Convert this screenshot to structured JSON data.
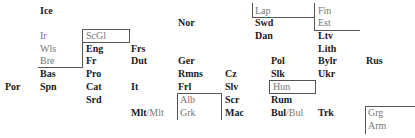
{
  "diagram": {
    "type": "language-map-grid",
    "labels": [
      {
        "id": "ice",
        "text": "Ice",
        "x": 40,
        "y": 5,
        "style": "bold"
      },
      {
        "id": "lap",
        "text": "Lap",
        "x": 255,
        "y": 5,
        "style": "gray"
      },
      {
        "id": "fin",
        "text": "Fin",
        "x": 318,
        "y": 5,
        "style": "gray"
      },
      {
        "id": "nor",
        "text": "Nor",
        "x": 178,
        "y": 17,
        "style": "bold"
      },
      {
        "id": "swd",
        "text": "Swd",
        "x": 255,
        "y": 17,
        "style": "bold"
      },
      {
        "id": "est",
        "text": "Est",
        "x": 318,
        "y": 17,
        "style": "gray"
      },
      {
        "id": "ir",
        "text": "Ir",
        "x": 40,
        "y": 30,
        "style": "gray"
      },
      {
        "id": "scgl",
        "text": "ScGl",
        "x": 86,
        "y": 30,
        "style": "gray"
      },
      {
        "id": "dan",
        "text": "Dan",
        "x": 255,
        "y": 30,
        "style": "bold"
      },
      {
        "id": "ltv",
        "text": "Ltv",
        "x": 318,
        "y": 30,
        "style": "bold"
      },
      {
        "id": "wls",
        "text": "Wls",
        "x": 40,
        "y": 43,
        "style": "gray"
      },
      {
        "id": "eng",
        "text": "Eng",
        "x": 86,
        "y": 43,
        "style": "bold"
      },
      {
        "id": "frs",
        "text": "Frs",
        "x": 131,
        "y": 43,
        "style": "bold"
      },
      {
        "id": "lith",
        "text": "Lith",
        "x": 318,
        "y": 43,
        "style": "bold"
      },
      {
        "id": "bre",
        "text": "Bre",
        "x": 40,
        "y": 55,
        "style": "gray"
      },
      {
        "id": "fr",
        "text": "Fr",
        "x": 86,
        "y": 55,
        "style": "bold"
      },
      {
        "id": "dut",
        "text": "Dut",
        "x": 131,
        "y": 55,
        "style": "bold"
      },
      {
        "id": "ger",
        "text": "Ger",
        "x": 178,
        "y": 55,
        "style": "bold"
      },
      {
        "id": "pol",
        "text": "Pol",
        "x": 271,
        "y": 55,
        "style": "bold"
      },
      {
        "id": "bylr",
        "text": "Bylr",
        "x": 318,
        "y": 55,
        "style": "bold"
      },
      {
        "id": "rus",
        "text": "Rus",
        "x": 366,
        "y": 55,
        "style": "bold"
      },
      {
        "id": "bas",
        "text": "Bas",
        "x": 40,
        "y": 68,
        "style": "bold"
      },
      {
        "id": "pro",
        "text": "Pro",
        "x": 86,
        "y": 68,
        "style": "bold"
      },
      {
        "id": "rmns",
        "text": "Rmns",
        "x": 178,
        "y": 68,
        "style": "bold"
      },
      {
        "id": "cz",
        "text": "Cz",
        "x": 225,
        "y": 68,
        "style": "bold"
      },
      {
        "id": "slk",
        "text": "Slk",
        "x": 271,
        "y": 68,
        "style": "bold"
      },
      {
        "id": "ukr",
        "text": "Ukr",
        "x": 318,
        "y": 68,
        "style": "bold"
      },
      {
        "id": "por",
        "text": "Por",
        "x": 5,
        "y": 81,
        "style": "bold"
      },
      {
        "id": "spn",
        "text": "Spn",
        "x": 40,
        "y": 81,
        "style": "bold"
      },
      {
        "id": "cat",
        "text": "Cat",
        "x": 86,
        "y": 81,
        "style": "bold"
      },
      {
        "id": "it",
        "text": "It",
        "x": 131,
        "y": 81,
        "style": "bold"
      },
      {
        "id": "frl",
        "text": "Frl",
        "x": 178,
        "y": 81,
        "style": "bold"
      },
      {
        "id": "slv",
        "text": "Slv",
        "x": 225,
        "y": 81,
        "style": "bold"
      },
      {
        "id": "hun",
        "text": "Hun",
        "x": 271,
        "y": 81,
        "style": "gray"
      },
      {
        "id": "srd",
        "text": "Srd",
        "x": 86,
        "y": 94,
        "style": "bold"
      },
      {
        "id": "alb",
        "text": "Alb",
        "x": 178,
        "y": 94,
        "style": "gray"
      },
      {
        "id": "scr",
        "text": "Scr",
        "x": 225,
        "y": 94,
        "style": "bold"
      },
      {
        "id": "rum",
        "text": "Rum",
        "x": 271,
        "y": 94,
        "style": "bold"
      },
      {
        "id": "grk",
        "text": "Grk",
        "x": 178,
        "y": 107,
        "style": "gray"
      },
      {
        "id": "mac",
        "text": "Mac",
        "x": 225,
        "y": 107,
        "style": "bold"
      },
      {
        "id": "trk",
        "text": "Trk",
        "x": 318,
        "y": 107,
        "style": "bold"
      },
      {
        "id": "grg",
        "text": "Grg",
        "x": 366,
        "y": 107,
        "style": "gray"
      },
      {
        "id": "arm",
        "text": "Arm",
        "x": 366,
        "y": 120,
        "style": "gray"
      }
    ],
    "split_labels": [
      {
        "id": "mlt",
        "bold": "Mlt",
        "sep": "/",
        "gray": "Mlt",
        "x": 131,
        "y": 107
      },
      {
        "id": "bul",
        "bold": "Bul",
        "sep": "/",
        "gray": "Bul",
        "x": 271,
        "y": 107
      }
    ]
  }
}
